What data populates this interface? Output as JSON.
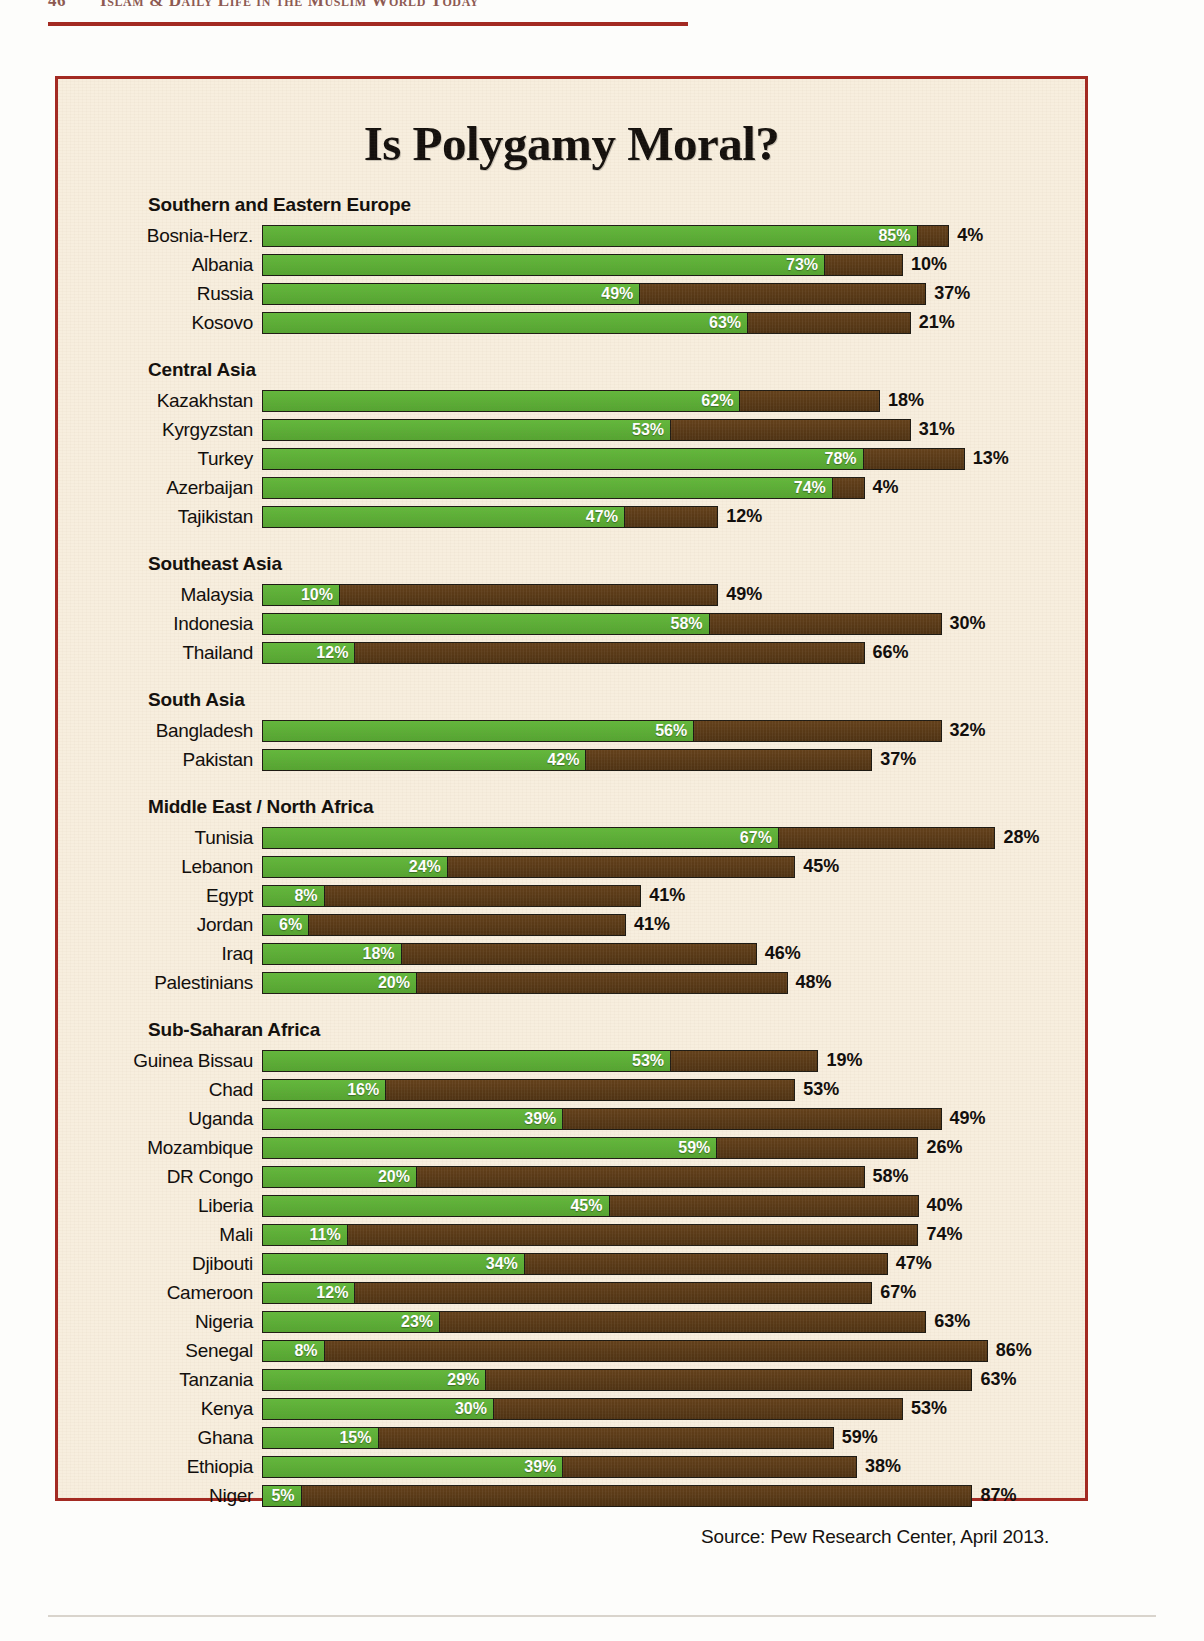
{
  "running_head": {
    "folio": "46",
    "title": "Islam & Daily Life in the Muslim World Today"
  },
  "figure": {
    "title": "Is Polygamy Moral?",
    "source": "Source: Pew Research Center, April 2013."
  },
  "colors": {
    "green": "#5cb037",
    "brown": "#5c3b17",
    "frame": "#a32a22",
    "paper": "#f7eede",
    "rule": "#a32a22"
  },
  "chart_data": {
    "type": "bar",
    "orientation": "horizontal",
    "stacked": true,
    "title": "Is Polygamy Moral?",
    "xlabel": "",
    "ylabel": "",
    "xlim": [
      0,
      100
    ],
    "grid": false,
    "legend_position": "none",
    "series": [
      {
        "name": "green-segment",
        "color": "#5cb037"
      },
      {
        "name": "brown-segment",
        "color": "#5c3b17"
      }
    ],
    "source": "Source: Pew Research Center, April 2013.",
    "groups": [
      {
        "name": "Southern and Eastern Europe",
        "rows": [
          {
            "label": "Bosnia-Herz.",
            "green": 85,
            "brown": 4,
            "green_text": "85%",
            "brown_text": "4%"
          },
          {
            "label": "Albania",
            "green": 73,
            "brown": 10,
            "green_text": "73%",
            "brown_text": "10%"
          },
          {
            "label": "Russia",
            "green": 49,
            "brown": 37,
            "green_text": "49%",
            "brown_text": "37%"
          },
          {
            "label": "Kosovo",
            "green": 63,
            "brown": 21,
            "green_text": "63%",
            "brown_text": "21%"
          }
        ]
      },
      {
        "name": "Central Asia",
        "rows": [
          {
            "label": "Kazakhstan",
            "green": 62,
            "brown": 18,
            "green_text": "62%",
            "brown_text": "18%"
          },
          {
            "label": "Kyrgyzstan",
            "green": 53,
            "brown": 31,
            "green_text": "53%",
            "brown_text": "31%"
          },
          {
            "label": "Turkey",
            "green": 78,
            "brown": 13,
            "green_text": "78%",
            "brown_text": "13%"
          },
          {
            "label": "Azerbaijan",
            "green": 74,
            "brown": 4,
            "green_text": "74%",
            "brown_text": "4%"
          },
          {
            "label": "Tajikistan",
            "green": 47,
            "brown": 12,
            "green_text": "47%",
            "brown_text": "12%"
          }
        ]
      },
      {
        "name": "Southeast Asia",
        "rows": [
          {
            "label": "Malaysia",
            "green": 10,
            "brown": 49,
            "green_text": "10%",
            "brown_text": "49%"
          },
          {
            "label": "Indonesia",
            "green": 58,
            "brown": 30,
            "green_text": "58%",
            "brown_text": "30%"
          },
          {
            "label": "Thailand",
            "green": 12,
            "brown": 66,
            "green_text": "12%",
            "brown_text": "66%"
          }
        ]
      },
      {
        "name": "South Asia",
        "rows": [
          {
            "label": "Bangladesh",
            "green": 56,
            "brown": 32,
            "green_text": "56%",
            "brown_text": "32%"
          },
          {
            "label": "Pakistan",
            "green": 42,
            "brown": 37,
            "green_text": "42%",
            "brown_text": "37%"
          }
        ]
      },
      {
        "name": "Middle East / North Africa",
        "rows": [
          {
            "label": "Tunisia",
            "green": 67,
            "brown": 28,
            "green_text": "67%",
            "brown_text": "28%"
          },
          {
            "label": "Lebanon",
            "green": 24,
            "brown": 45,
            "green_text": "24%",
            "brown_text": "45%"
          },
          {
            "label": "Egypt",
            "green": 8,
            "brown": 41,
            "green_text": "8%",
            "brown_text": "41%"
          },
          {
            "label": "Jordan",
            "green": 6,
            "brown": 41,
            "green_text": "6%",
            "brown_text": "41%"
          },
          {
            "label": "Iraq",
            "green": 18,
            "brown": 46,
            "green_text": "18%",
            "brown_text": "46%"
          },
          {
            "label": "Palestinians",
            "green": 20,
            "brown": 48,
            "green_text": "20%",
            "brown_text": "48%"
          }
        ]
      },
      {
        "name": "Sub-Saharan Africa",
        "rows": [
          {
            "label": "Guinea Bissau",
            "green": 53,
            "brown": 19,
            "green_text": "53%",
            "brown_text": "19%"
          },
          {
            "label": "Chad",
            "green": 16,
            "brown": 53,
            "green_text": "16%",
            "brown_text": "53%"
          },
          {
            "label": "Uganda",
            "green": 39,
            "brown": 49,
            "green_text": "39%",
            "brown_text": "49%"
          },
          {
            "label": "Mozambique",
            "green": 59,
            "brown": 26,
            "green_text": "59%",
            "brown_text": "26%"
          },
          {
            "label": "DR Congo",
            "green": 20,
            "brown": 58,
            "green_text": "20%",
            "brown_text": "58%"
          },
          {
            "label": "Liberia",
            "green": 45,
            "brown": 40,
            "green_text": "45%",
            "brown_text": "40%"
          },
          {
            "label": "Mali",
            "green": 11,
            "brown": 74,
            "green_text": "11%",
            "brown_text": "74%"
          },
          {
            "label": "Djibouti",
            "green": 34,
            "brown": 47,
            "green_text": "34%",
            "brown_text": "47%"
          },
          {
            "label": "Cameroon",
            "green": 12,
            "brown": 67,
            "green_text": "12%",
            "brown_text": "67%"
          },
          {
            "label": "Nigeria",
            "green": 23,
            "brown": 63,
            "green_text": "23%",
            "brown_text": "63%"
          },
          {
            "label": "Senegal",
            "green": 8,
            "brown": 86,
            "green_text": "8%",
            "brown_text": "86%"
          },
          {
            "label": "Tanzania",
            "green": 29,
            "brown": 63,
            "green_text": "29%",
            "brown_text": "63%"
          },
          {
            "label": "Kenya",
            "green": 30,
            "brown": 53,
            "green_text": "30%",
            "brown_text": "53%"
          },
          {
            "label": "Ghana",
            "green": 15,
            "brown": 59,
            "green_text": "15%",
            "brown_text": "59%"
          },
          {
            "label": "Ethiopia",
            "green": 39,
            "brown": 38,
            "green_text": "39%",
            "brown_text": "38%"
          },
          {
            "label": "Niger",
            "green": 5,
            "brown": 87,
            "green_text": "5%",
            "brown_text": "87%"
          }
        ]
      }
    ]
  }
}
